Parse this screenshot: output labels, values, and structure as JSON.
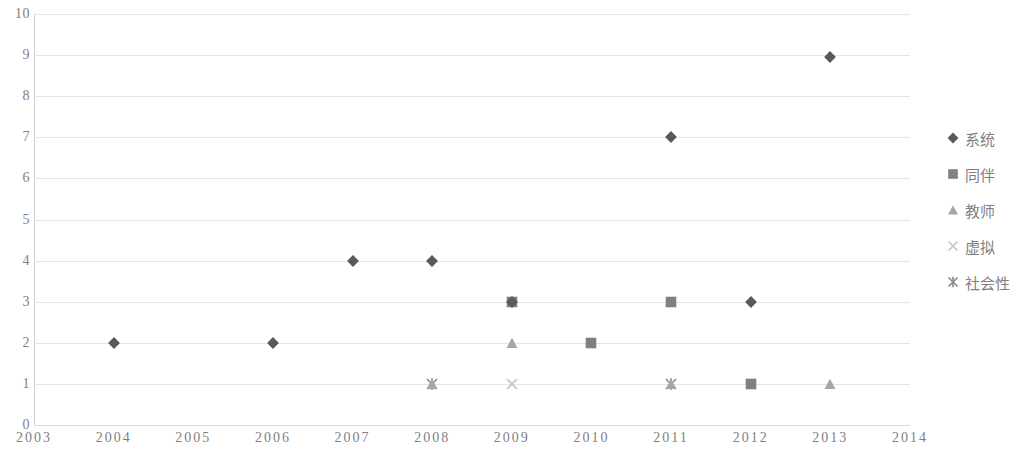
{
  "chart_data": {
    "type": "scatter",
    "title": "",
    "subtitle": "",
    "xlabel": "",
    "ylabel": "",
    "xlim": [
      2003,
      2014
    ],
    "ylim": [
      0,
      10
    ],
    "x_ticks": [
      "2003",
      "2004",
      "2005",
      "2006",
      "2007",
      "2008",
      "2009",
      "2010",
      "2011",
      "2012",
      "2013",
      "2014"
    ],
    "y_ticks": [
      "0",
      "1",
      "2",
      "3",
      "4",
      "5",
      "6",
      "7",
      "8",
      "9",
      "10"
    ],
    "grid": "horizontal",
    "legend_position": "right",
    "series": [
      {
        "name": "系统",
        "marker": "diamond",
        "color": "#595959",
        "points": [
          {
            "x": 2004,
            "y": 2
          },
          {
            "x": 2006,
            "y": 2
          },
          {
            "x": 2007,
            "y": 4
          },
          {
            "x": 2008,
            "y": 4
          },
          {
            "x": 2009,
            "y": 3
          },
          {
            "x": 2011,
            "y": 7
          },
          {
            "x": 2012,
            "y": 3
          },
          {
            "x": 2013,
            "y": 8.95
          }
        ]
      },
      {
        "name": "同伴",
        "marker": "square",
        "color": "#808080",
        "points": [
          {
            "x": 2009,
            "y": 3
          },
          {
            "x": 2010,
            "y": 2
          },
          {
            "x": 2011,
            "y": 3
          },
          {
            "x": 2012,
            "y": 1
          }
        ]
      },
      {
        "name": "教师",
        "marker": "triangle",
        "color": "#a6a6a6",
        "points": [
          {
            "x": 2008,
            "y": 1
          },
          {
            "x": 2009,
            "y": 2
          },
          {
            "x": 2011,
            "y": 1
          },
          {
            "x": 2013,
            "y": 1
          }
        ]
      },
      {
        "name": "虚拟",
        "marker": "cross",
        "color": "#c4c4c4",
        "points": [
          {
            "x": 2009,
            "y": 1
          }
        ]
      },
      {
        "name": "社会性",
        "marker": "asterisk",
        "color": "#8c8c8c",
        "points": [
          {
            "x": 2008,
            "y": 1
          },
          {
            "x": 2011,
            "y": 1
          }
        ]
      }
    ]
  },
  "legend": {
    "items": [
      {
        "label": "系统",
        "marker": "diamond",
        "color": "#595959"
      },
      {
        "label": "同伴",
        "marker": "square",
        "color": "#808080"
      },
      {
        "label": "教师",
        "marker": "triangle",
        "color": "#a6a6a6"
      },
      {
        "label": "虚拟",
        "marker": "cross",
        "color": "#c4c4c4"
      },
      {
        "label": "社会性",
        "marker": "asterisk",
        "color": "#8c8c8c"
      }
    ]
  },
  "colors": {
    "background": "#ffffff",
    "grid": "#e4e4e4",
    "axis": "#d0d0d0",
    "tick_text": "#7f7f7f"
  }
}
